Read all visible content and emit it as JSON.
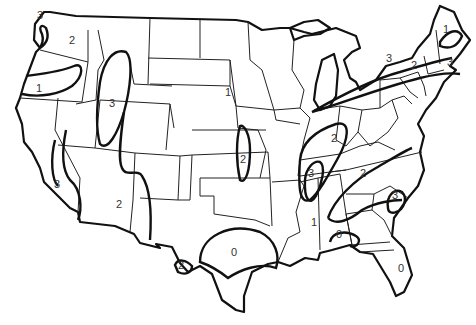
{
  "map": {
    "subject": "Contiguous United States zone map",
    "colors": {
      "background": "#ffffff",
      "lines": "#111111",
      "labels": "#333333"
    },
    "zone_labels": [
      {
        "id": "wa-coast",
        "value": "3",
        "x": 40,
        "y": 19
      },
      {
        "id": "wa-east",
        "value": "2",
        "x": 72,
        "y": 44
      },
      {
        "id": "or-oval",
        "value": "1",
        "x": 39,
        "y": 92
      },
      {
        "id": "id-ut-oval",
        "value": "3",
        "x": 112,
        "y": 107
      },
      {
        "id": "ca",
        "value": "3",
        "x": 57,
        "y": 188
      },
      {
        "id": "az",
        "value": "2",
        "x": 119,
        "y": 208
      },
      {
        "id": "sd",
        "value": "1",
        "x": 228,
        "y": 96
      },
      {
        "id": "ks-oval",
        "value": "2",
        "x": 243,
        "y": 163
      },
      {
        "id": "tx-rio",
        "value": "2",
        "x": 181,
        "y": 269
      },
      {
        "id": "tx",
        "value": "0",
        "x": 234,
        "y": 256
      },
      {
        "id": "maine",
        "value": "1",
        "x": 446,
        "y": 33
      },
      {
        "id": "ny-west",
        "value": "3",
        "x": 389,
        "y": 62
      },
      {
        "id": "ny",
        "value": "2",
        "x": 414,
        "y": 69
      },
      {
        "id": "ma",
        "value": "3",
        "x": 450,
        "y": 66
      },
      {
        "id": "in-ky",
        "value": "2",
        "x": 334,
        "y": 142
      },
      {
        "id": "ms-valley",
        "value": "3",
        "x": 311,
        "y": 177
      },
      {
        "id": "tn-va",
        "value": "2",
        "x": 363,
        "y": 177
      },
      {
        "id": "sc",
        "value": "3",
        "x": 395,
        "y": 199
      },
      {
        "id": "ms",
        "value": "1",
        "x": 314,
        "y": 226
      },
      {
        "id": "gulf",
        "value": "0",
        "x": 339,
        "y": 238
      },
      {
        "id": "fl",
        "value": "0",
        "x": 401,
        "y": 272
      }
    ]
  }
}
